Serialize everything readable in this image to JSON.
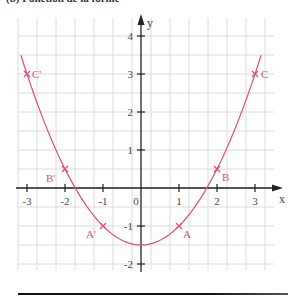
{
  "header": {
    "cut_title": "(b) Fonction de la forme"
  },
  "chart_data": {
    "type": "line",
    "title": "",
    "xlabel": "x",
    "ylabel": "y",
    "xlim": [
      -3.2,
      3.3
    ],
    "ylim": [
      -2.15,
      4.6
    ],
    "grid": true,
    "grid_step": 0.5,
    "x_ticks": [
      -3,
      -2,
      -1,
      0,
      1,
      2,
      3
    ],
    "y_ticks": [
      -2,
      -1,
      1,
      2,
      3,
      4
    ],
    "x_tick_labels": [
      "-3",
      "-2",
      "-1",
      "0",
      "1",
      "2",
      "3"
    ],
    "y_tick_labels": [
      "-2",
      "-1",
      "1",
      "2",
      "3",
      "4"
    ],
    "series": [
      {
        "name": "y = 0.5x² − 1.5",
        "function": "0.5*x^2-1.5",
        "x_range": [
          -3.16,
          3.16
        ],
        "color": "#e0506e"
      }
    ],
    "points": [
      {
        "label": "A",
        "x": 1,
        "y": -1
      },
      {
        "label": "A'",
        "x": -1,
        "y": -1
      },
      {
        "label": "B",
        "x": 2,
        "y": 0.5
      },
      {
        "label": "B'",
        "x": -2,
        "y": 0.5
      },
      {
        "label": "C",
        "x": 3,
        "y": 3
      },
      {
        "label": "C'",
        "x": -3,
        "y": 3
      }
    ],
    "colors": {
      "curve": "#e0506e",
      "axis": "#222222",
      "grid": "#dcdcdc",
      "tick_text": "#444444"
    }
  }
}
